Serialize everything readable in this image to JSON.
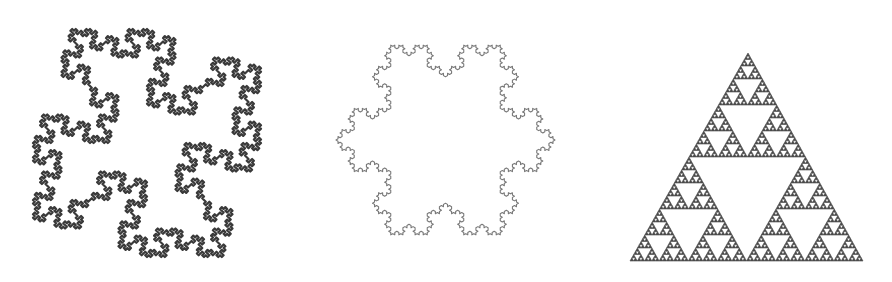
{
  "figures": [
    {
      "id": "quadratic-koch-island",
      "name": "Quadratic Koch island",
      "type": "lsystem",
      "axiom": "F+F+F+F",
      "rules": {
        "F": "F+F-F-FF+F+F-F"
      },
      "angle": 90,
      "iterations": 3,
      "rotation": 45,
      "box": {
        "x": 33,
        "y": 26,
        "w": 228,
        "h": 234
      },
      "stroke": "#3a3a3a",
      "stroke_width": 2.2
    },
    {
      "id": "koch-snowflake",
      "name": "Koch snowflake",
      "type": "lsystem",
      "axiom": "F--F--F",
      "rules": {
        "F": "F+F--F+F"
      },
      "angle": 60,
      "iterations": 4,
      "rotation": 90,
      "box": {
        "x": 336,
        "y": 13,
        "w": 219,
        "h": 254
      },
      "stroke": "#7a7a7a",
      "stroke_width": 1.1
    },
    {
      "id": "sierpinski-triangle",
      "name": "Sierpinski triangle",
      "type": "sierpinski",
      "depth": 6,
      "apex": {
        "x": 748,
        "y": 53
      },
      "base_left": {
        "x": 630,
        "y": 261
      },
      "base_right": {
        "x": 863,
        "y": 261
      },
      "fill": "#4a4a4a"
    }
  ]
}
